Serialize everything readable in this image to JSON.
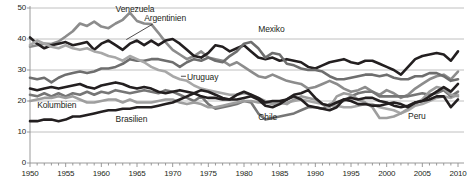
{
  "chart_data": {
    "type": "line",
    "title": "",
    "subtitle": "",
    "xlabel": "",
    "ylabel": "",
    "xlim": [
      1950,
      2010
    ],
    "ylim": [
      0,
      50
    ],
    "yticks": [
      0,
      10,
      20,
      30,
      40,
      50
    ],
    "xticks": [
      1950,
      1955,
      1960,
      1965,
      1970,
      1975,
      1980,
      1985,
      1990,
      1995,
      2000,
      2005,
      2010
    ],
    "xtick_labels": [
      "1950",
      "1955",
      "1960",
      "1965",
      "1970",
      "1975",
      "1980",
      "1985",
      "1990",
      "1995",
      "2000",
      "2005",
      "2010"
    ],
    "ytick_labels": [
      "0",
      "10",
      "20",
      "30",
      "40",
      "50"
    ],
    "grid": "horizontal",
    "legend": "inline-labels",
    "minor_xticks_interval": 1,
    "x": [
      1950,
      1951,
      1952,
      1953,
      1954,
      1955,
      1956,
      1957,
      1958,
      1959,
      1960,
      1961,
      1962,
      1963,
      1964,
      1965,
      1966,
      1967,
      1968,
      1969,
      1970,
      1971,
      1972,
      1973,
      1974,
      1975,
      1976,
      1977,
      1978,
      1979,
      1980,
      1981,
      1982,
      1983,
      1984,
      1985,
      1986,
      1987,
      1988,
      1989,
      1990,
      1991,
      1992,
      1993,
      1994,
      1995,
      1996,
      1997,
      1998,
      1999,
      2000,
      2001,
      2002,
      2003,
      2004,
      2005,
      2006,
      2007,
      2008,
      2009,
      2010
    ],
    "series": [
      {
        "name": "Venezuela",
        "color": "#8c8c8c",
        "width": 2.6,
        "label_x": 1962,
        "label_y": 49.5,
        "values": [
          37.5,
          38.0,
          38.5,
          38.4,
          39.2,
          40.8,
          42.5,
          45.0,
          44.2,
          45.6,
          44.0,
          43.5,
          45.0,
          46.2,
          48.5,
          45.8,
          45.0,
          44.8,
          42.0,
          39.0,
          36.5,
          35.0,
          33.5,
          34.5,
          36.0,
          34.0,
          33.5,
          33.0,
          31.5,
          32.5,
          31.0,
          29.5,
          28.0,
          27.5,
          28.5,
          27.5,
          26.5,
          26.0,
          25.5,
          24.0,
          24.5,
          25.5,
          26.5,
          25.5,
          24.0,
          23.0,
          23.5,
          24.5,
          23.0,
          22.0,
          23.5,
          22.5,
          21.0,
          22.0,
          24.0,
          25.5,
          27.0,
          28.0,
          28.5,
          27.0,
          29.5
        ]
      },
      {
        "name": "Argentinien",
        "color": "#231f20",
        "width": 2.6,
        "label_x": 1966,
        "label_y": 46.5,
        "values": [
          40.5,
          38.5,
          37.0,
          38.0,
          38.5,
          39.0,
          38.0,
          38.5,
          39.0,
          36.5,
          38.5,
          39.5,
          38.0,
          36.5,
          38.5,
          39.5,
          38.0,
          39.5,
          38.0,
          39.5,
          40.0,
          38.5,
          36.5,
          34.5,
          34.0,
          35.5,
          38.0,
          37.5,
          36.0,
          37.0,
          38.0,
          36.0,
          34.0,
          33.5,
          34.0,
          33.0,
          33.5,
          33.0,
          32.5,
          31.0,
          30.5,
          31.5,
          32.5,
          33.0,
          33.5,
          32.5,
          32.0,
          33.0,
          33.0,
          32.0,
          31.0,
          30.0,
          28.5,
          31.0,
          33.5,
          34.5,
          35.0,
          35.5,
          35.0,
          33.0,
          36.0
        ]
      },
      {
        "name": "Mexiko",
        "color": "#6e6e6e",
        "width": 2.6,
        "label_x": 1982,
        "label_y": 43.0,
        "values": [
          27.5,
          27.0,
          27.5,
          26.0,
          27.5,
          28.5,
          29.0,
          29.5,
          29.0,
          29.5,
          30.5,
          30.5,
          31.0,
          32.0,
          33.5,
          33.0,
          33.0,
          33.5,
          33.5,
          33.0,
          32.5,
          31.0,
          32.5,
          33.5,
          33.0,
          34.0,
          33.0,
          32.5,
          34.5,
          36.0,
          38.5,
          39.0,
          37.0,
          34.0,
          35.5,
          35.0,
          32.0,
          31.5,
          30.5,
          30.0,
          30.0,
          29.5,
          28.0,
          27.0,
          27.0,
          27.5,
          28.0,
          28.5,
          28.5,
          28.0,
          28.5,
          27.5,
          27.0,
          27.0,
          28.0,
          28.0,
          29.0,
          29.0,
          28.0,
          26.5,
          27.0
        ]
      },
      {
        "name": "Uruguay",
        "color": "#a8a8a8",
        "width": 2.6,
        "label_x": 1972,
        "label_y": 27.5,
        "values": [
          38.0,
          39.5,
          38.5,
          37.5,
          37.0,
          38.0,
          37.0,
          36.5,
          37.0,
          36.0,
          35.5,
          34.5,
          34.0,
          33.0,
          34.5,
          33.5,
          32.5,
          31.0,
          30.0,
          29.5,
          28.0,
          27.0,
          26.5,
          25.0,
          24.0,
          23.5,
          23.0,
          22.5,
          22.0,
          22.0,
          22.5,
          22.0,
          21.0,
          20.0,
          19.5,
          19.0,
          19.5,
          20.0,
          20.5,
          20.0,
          19.5,
          19.0,
          18.5,
          18.5,
          18.0,
          18.0,
          18.5,
          19.0,
          19.0,
          18.0,
          17.5,
          17.0,
          16.0,
          17.0,
          18.5,
          19.0,
          20.0,
          21.0,
          21.5,
          21.0,
          22.0
        ]
      },
      {
        "name": "Chile",
        "color": "#767676",
        "width": 2.6,
        "label_x": 1982,
        "label_y": 14.5,
        "values": [
          22.0,
          21.5,
          22.5,
          21.5,
          22.5,
          21.5,
          22.5,
          22.0,
          23.0,
          22.0,
          23.0,
          22.5,
          23.5,
          23.0,
          22.5,
          23.0,
          23.5,
          23.0,
          22.5,
          23.5,
          23.0,
          22.0,
          21.0,
          20.0,
          21.5,
          19.0,
          17.5,
          18.0,
          18.5,
          19.0,
          20.0,
          19.5,
          16.0,
          14.0,
          14.5,
          15.0,
          15.5,
          16.0,
          17.0,
          18.0,
          18.0,
          17.5,
          19.0,
          19.5,
          20.0,
          21.5,
          22.5,
          23.0,
          23.0,
          21.5,
          21.5,
          21.5,
          21.5,
          21.5,
          22.0,
          22.5,
          22.0,
          22.5,
          23.5,
          21.5,
          23.0
        ]
      },
      {
        "name": "Kolumbien",
        "color": "#9e9e9e",
        "width": 2.6,
        "label_x": 1951,
        "label_y": 18.5,
        "values": [
          20.0,
          20.5,
          21.0,
          21.0,
          21.5,
          21.0,
          21.5,
          20.5,
          19.5,
          19.5,
          20.0,
          20.5,
          20.5,
          19.5,
          20.5,
          19.5,
          19.5,
          19.5,
          20.0,
          20.5,
          20.5,
          19.5,
          19.0,
          19.5,
          19.0,
          18.0,
          18.0,
          18.5,
          19.0,
          19.5,
          20.0,
          20.0,
          19.5,
          19.5,
          19.0,
          19.5,
          19.0,
          20.5,
          21.5,
          21.0,
          20.5,
          19.0,
          18.0,
          21.5,
          22.5,
          22.0,
          20.5,
          19.5,
          18.0,
          14.5,
          14.5,
          15.0,
          16.0,
          17.5,
          19.0,
          20.5,
          23.0,
          24.5,
          24.0,
          22.0,
          21.5
        ]
      },
      {
        "name": "Brasilien",
        "color": "#231f20",
        "width": 2.6,
        "label_x": 1962,
        "label_y": 14.0,
        "values": [
          13.5,
          13.5,
          14.0,
          14.0,
          13.5,
          14.0,
          15.0,
          15.0,
          15.5,
          16.0,
          16.5,
          17.0,
          17.0,
          17.5,
          17.5,
          18.0,
          18.0,
          18.0,
          18.5,
          19.0,
          19.5,
          20.5,
          21.5,
          22.5,
          21.5,
          21.0,
          21.0,
          20.5,
          20.5,
          20.5,
          21.0,
          21.5,
          20.5,
          18.5,
          18.0,
          19.0,
          20.5,
          22.0,
          22.5,
          23.5,
          21.0,
          19.0,
          18.5,
          19.5,
          20.5,
          20.0,
          19.0,
          19.0,
          18.5,
          18.5,
          19.0,
          19.5,
          19.0,
          18.0,
          19.5,
          20.0,
          20.5,
          21.5,
          21.5,
          18.0,
          20.5
        ]
      },
      {
        "name": "Peru",
        "color": "#231f20",
        "width": 2.6,
        "label_x": 2003,
        "label_y": 15.0,
        "values": [
          24.0,
          23.5,
          24.0,
          24.5,
          24.0,
          24.5,
          25.0,
          25.5,
          24.5,
          24.0,
          25.0,
          25.5,
          26.0,
          25.5,
          24.5,
          24.0,
          24.5,
          24.0,
          23.0,
          22.5,
          23.0,
          23.5,
          23.0,
          22.5,
          23.5,
          23.0,
          22.0,
          21.0,
          20.5,
          22.0,
          23.0,
          22.0,
          21.0,
          19.5,
          20.0,
          20.0,
          20.5,
          21.5,
          20.5,
          18.5,
          18.0,
          17.5,
          17.0,
          18.0,
          20.5,
          21.0,
          20.5,
          21.0,
          21.0,
          20.0,
          19.5,
          18.5,
          18.0,
          18.5,
          19.5,
          20.0,
          21.5,
          23.0,
          24.5,
          23.0,
          25.5
        ]
      }
    ],
    "annotations": [
      {
        "name": "argentinien-leader",
        "from_x": 1967.2,
        "from_y": 44.8,
        "to_x": 1963.5,
        "to_y": 39.8
      }
    ]
  }
}
